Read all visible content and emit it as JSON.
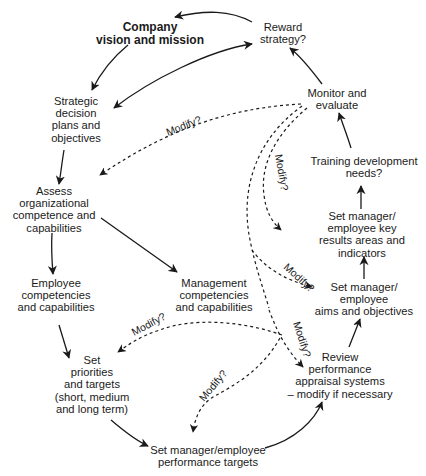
{
  "diagram": {
    "type": "cycle-flowchart",
    "nodes": [
      {
        "id": "vision",
        "lines": [
          "Company",
          "vision and mission"
        ],
        "bold": true
      },
      {
        "id": "reward",
        "lines": [
          "Reward",
          "strategy?"
        ]
      },
      {
        "id": "strategic",
        "lines": [
          "Strategic",
          "decision",
          "plans and",
          "objectives"
        ]
      },
      {
        "id": "monitor",
        "lines": [
          "Monitor and",
          "evaluate"
        ]
      },
      {
        "id": "training",
        "lines": [
          "Training development",
          "needs?"
        ]
      },
      {
        "id": "assess",
        "lines": [
          "Assess",
          "organizational",
          "competence and",
          "capabilities"
        ]
      },
      {
        "id": "kra",
        "lines": [
          "Set manager/",
          "employee key",
          "results areas and",
          "indicators"
        ]
      },
      {
        "id": "employee_comp",
        "lines": [
          "Employee",
          "competencies",
          "and capabilities"
        ]
      },
      {
        "id": "mgmt_comp",
        "lines": [
          "Management",
          "competencies",
          "and capabilities"
        ]
      },
      {
        "id": "aims",
        "lines": [
          "Set manager/",
          "employee",
          "aims and objectives"
        ]
      },
      {
        "id": "priorities",
        "lines": [
          "Set",
          "priorities",
          "and targets",
          "(short, medium",
          "and long term)"
        ]
      },
      {
        "id": "review",
        "lines": [
          "Review",
          "performance",
          "appraisal systems",
          "– modify if necessary"
        ]
      },
      {
        "id": "perf_targets",
        "lines": [
          "Set manager/employee",
          "performance targets"
        ]
      }
    ],
    "solid_edges": [
      {
        "from": "reward",
        "to": "vision"
      },
      {
        "from": "vision",
        "to": "strategic"
      },
      {
        "from": "strategic",
        "to": "reward",
        "note": "bidirectional curve"
      },
      {
        "from": "monitor",
        "to": "reward"
      },
      {
        "from": "training",
        "to": "monitor"
      },
      {
        "from": "kra",
        "to": "training"
      },
      {
        "from": "aims",
        "to": "kra"
      },
      {
        "from": "review",
        "to": "aims"
      },
      {
        "from": "perf_targets",
        "to": "review"
      },
      {
        "from": "priorities",
        "to": "perf_targets"
      },
      {
        "from": "employee_comp",
        "to": "priorities"
      },
      {
        "from": "assess",
        "to": "employee_comp"
      },
      {
        "from": "assess",
        "to": "mgmt_comp"
      },
      {
        "from": "strategic",
        "to": "assess"
      }
    ],
    "dashed_edges": [
      {
        "from": "monitor",
        "to": "assess",
        "label": "Modify?"
      },
      {
        "from": "monitor",
        "to": "kra",
        "label": "Modify?"
      },
      {
        "from": "monitor",
        "to": "aims",
        "label": "Modify?"
      },
      {
        "from": "monitor",
        "to": "review",
        "label": "Modify?"
      },
      {
        "from": "hub",
        "to": "priorities",
        "label": "Modify?"
      },
      {
        "from": "hub",
        "to": "perf_targets",
        "label": "Modify?"
      }
    ],
    "modify_label": "Modify?"
  }
}
